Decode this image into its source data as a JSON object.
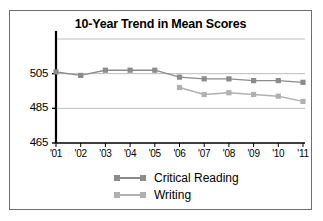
{
  "chart_data": {
    "type": "line",
    "title": "10-Year Trend in Mean Scores",
    "xlabel": "",
    "ylabel": "",
    "categories": [
      "'01",
      "'02",
      "'03",
      "'04",
      "'05",
      "'06",
      "'07",
      "'08",
      "'09",
      "'10",
      "'11"
    ],
    "ylim": [
      465,
      525
    ],
    "yticks": [
      465,
      485,
      505
    ],
    "ytick_labels": [
      "465",
      "485",
      "505"
    ],
    "gridlines": [
      485,
      505,
      525
    ],
    "grid": true,
    "legend_position": "bottom",
    "series": [
      {
        "name": "Critical Reading",
        "color": "#8c8c8c",
        "values": [
          506,
          504,
          507,
          507,
          507,
          503,
          502,
          502,
          501,
          501,
          500
        ]
      },
      {
        "name": "Writing",
        "color": "#b0b0b0",
        "values": [
          null,
          null,
          null,
          null,
          null,
          497,
          493,
          494,
          493,
          492,
          489
        ]
      }
    ]
  },
  "legend": {
    "items": [
      {
        "label": "Critical Reading",
        "color": "#8c8c8c"
      },
      {
        "label": "Writing",
        "color": "#b0b0b0"
      }
    ]
  },
  "colors": {
    "frame": "#6e6e6e",
    "axis": "#000000",
    "grid": "#bdbdbd",
    "critical_reading": "#8c8c8c",
    "writing": "#b0b0b0",
    "background": "#ffffff"
  }
}
